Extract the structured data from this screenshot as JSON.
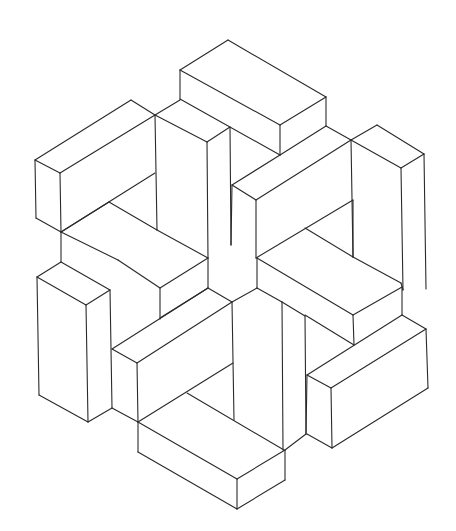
{
  "figure": {
    "stroke_color": "#2a2a2a",
    "background": "#ffffff",
    "segments": [
      [
        228,
        40,
        180,
        70
      ],
      [
        228,
        40,
        326,
        97
      ],
      [
        180,
        70,
        180,
        99
      ],
      [
        180,
        70,
        280,
        125
      ],
      [
        280,
        125,
        326,
        97
      ],
      [
        280,
        125,
        280,
        155
      ],
      [
        326,
        97,
        326,
        126
      ],
      [
        180,
        99,
        280,
        155
      ],
      [
        280,
        155,
        326,
        126
      ],
      [
        326,
        126,
        351,
        140
      ],
      [
        351,
        140,
        377,
        125
      ],
      [
        377,
        125,
        424,
        154
      ],
      [
        424,
        154,
        401,
        168
      ],
      [
        401,
        168,
        351,
        140
      ],
      [
        424,
        154,
        426,
        289
      ],
      [
        401,
        168,
        403,
        290
      ],
      [
        351,
        140,
        353,
        257
      ],
      [
        280,
        155,
        232,
        185
      ],
      [
        232,
        185,
        231,
        245
      ],
      [
        232,
        185,
        256,
        200
      ],
      [
        256,
        200,
        351,
        140
      ],
      [
        256,
        200,
        256,
        258
      ],
      [
        155,
        115,
        131,
        100
      ],
      [
        131,
        100,
        35,
        160
      ],
      [
        35,
        160,
        60,
        173
      ],
      [
        60,
        173,
        155,
        115
      ],
      [
        155,
        115,
        157,
        230
      ],
      [
        35,
        160,
        36,
        218
      ],
      [
        36,
        218,
        61,
        232
      ],
      [
        60,
        173,
        61,
        232
      ],
      [
        155,
        115,
        180,
        100
      ],
      [
        155,
        115,
        207,
        142
      ],
      [
        207,
        142,
        230,
        127
      ],
      [
        207,
        142,
        208,
        258
      ],
      [
        230,
        127,
        231,
        245
      ],
      [
        61,
        232,
        155,
        173
      ],
      [
        109,
        202,
        157,
        230
      ],
      [
        109,
        202,
        61,
        232
      ],
      [
        157,
        230,
        208,
        258
      ],
      [
        61,
        232,
        61,
        262
      ],
      [
        61,
        232,
        118,
        260
      ],
      [
        256,
        258,
        353,
        200
      ],
      [
        305,
        228,
        353,
        257
      ],
      [
        353,
        257,
        401,
        283
      ],
      [
        401,
        283,
        403,
        290
      ],
      [
        353,
        200,
        353,
        257
      ],
      [
        118,
        260,
        160,
        288
      ],
      [
        160,
        288,
        160,
        319
      ],
      [
        160,
        288,
        208,
        258
      ],
      [
        208,
        258,
        208,
        288
      ],
      [
        61,
        262,
        37,
        277
      ],
      [
        37,
        277,
        39,
        395
      ],
      [
        37,
        277,
        86,
        305
      ],
      [
        86,
        305,
        110,
        290
      ],
      [
        110,
        290,
        61,
        262
      ],
      [
        86,
        305,
        88,
        422
      ],
      [
        39,
        395,
        88,
        422
      ],
      [
        88,
        422,
        112,
        408
      ],
      [
        110,
        290,
        112,
        408
      ],
      [
        208,
        288,
        160,
        318
      ],
      [
        208,
        288,
        232,
        302
      ],
      [
        232,
        302,
        137,
        363
      ],
      [
        137,
        363,
        112,
        349
      ],
      [
        112,
        349,
        208,
        288
      ],
      [
        137,
        363,
        138,
        422
      ],
      [
        232,
        302,
        234,
        420
      ],
      [
        138,
        422,
        233,
        363
      ],
      [
        187,
        393,
        284,
        450
      ],
      [
        112,
        408,
        138,
        422
      ],
      [
        138,
        422,
        138,
        452
      ],
      [
        138,
        452,
        237,
        509
      ],
      [
        237,
        509,
        285,
        480
      ],
      [
        285,
        480,
        285,
        450
      ],
      [
        138,
        422,
        237,
        479
      ],
      [
        237,
        479,
        285,
        450
      ],
      [
        237,
        479,
        237,
        509
      ],
      [
        232,
        302,
        257,
        288
      ],
      [
        257,
        288,
        282,
        302
      ],
      [
        282,
        302,
        283,
        450
      ],
      [
        257,
        288,
        257,
        258
      ],
      [
        282,
        302,
        305,
        316
      ],
      [
        305,
        316,
        306,
        434
      ],
      [
        306,
        434,
        285,
        450
      ],
      [
        257,
        258,
        353,
        315
      ],
      [
        353,
        315,
        402,
        287
      ],
      [
        353,
        315,
        354,
        345
      ],
      [
        305,
        315,
        354,
        345
      ],
      [
        402,
        287,
        402,
        315
      ],
      [
        402,
        315,
        426,
        329
      ],
      [
        426,
        329,
        331,
        388
      ],
      [
        331,
        388,
        307,
        375
      ],
      [
        307,
        375,
        402,
        315
      ],
      [
        331,
        388,
        332,
        448
      ],
      [
        426,
        329,
        428,
        388
      ],
      [
        428,
        388,
        332,
        448
      ],
      [
        332,
        448,
        307,
        434
      ],
      [
        307,
        375,
        306,
        434
      ]
    ]
  }
}
